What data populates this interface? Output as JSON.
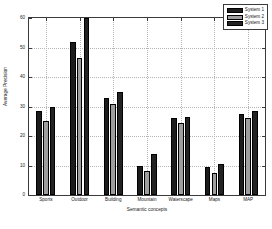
{
  "chart_data": {
    "type": "bar",
    "title": "",
    "xlabel": "Semantic concepts",
    "ylabel": "Average Precision",
    "categories": [
      "Sports",
      "Outdoor",
      "Building",
      "Mountain",
      "Waterscape",
      "Maps",
      "MAP"
    ],
    "series": [
      {
        "name": "System 1",
        "color": "#1c1c1c",
        "values": [
          28.5,
          52.0,
          33.0,
          10.0,
          26.0,
          9.5,
          27.5
        ]
      },
      {
        "name": "System 2",
        "color": "#9e9e9e",
        "values": [
          25.0,
          46.5,
          31.0,
          8.0,
          24.5,
          7.5,
          26.0
        ]
      },
      {
        "name": "System 3",
        "color": "#232323",
        "values": [
          30.0,
          60.0,
          35.0,
          14.0,
          26.5,
          10.5,
          28.5
        ]
      }
    ],
    "ylim": [
      0,
      60
    ],
    "yticks": [
      0,
      10,
      20,
      30,
      40,
      50,
      60
    ],
    "ytick_labels": [
      "0",
      "10",
      "20",
      "30",
      "40",
      "50",
      "60"
    ],
    "grid": true,
    "legend_position": "top-right"
  },
  "legend": {
    "entries": [
      {
        "label": "System 1"
      },
      {
        "label": "System 2"
      },
      {
        "label": "System 3"
      }
    ]
  }
}
